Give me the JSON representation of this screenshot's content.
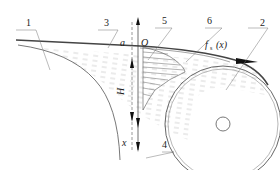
{
  "diagram": {
    "callouts": [
      {
        "id": "1",
        "label": "1"
      },
      {
        "id": "2",
        "label": "2"
      },
      {
        "id": "3",
        "label": "3"
      },
      {
        "id": "4",
        "label": "4"
      },
      {
        "id": "5",
        "label": "5"
      },
      {
        "id": "6",
        "label": "6"
      }
    ],
    "symbols": {
      "a": "a",
      "origin": "O",
      "H": "H",
      "x": "x",
      "function": "f",
      "function_sub": "s",
      "function_arg": "(x)"
    }
  }
}
